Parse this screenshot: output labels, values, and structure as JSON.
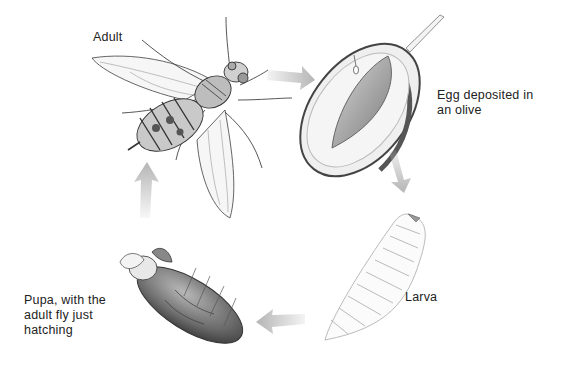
{
  "diagram": {
    "type": "life-cycle",
    "stages": [
      {
        "id": "adult",
        "label": "Adult"
      },
      {
        "id": "egg",
        "label_line1": "Egg deposited in",
        "label_line2": "an olive"
      },
      {
        "id": "larva",
        "label": "Larva"
      },
      {
        "id": "pupa",
        "label_line1": "Pupa, with the",
        "label_line2": "adult fly just",
        "label_line3": "hatching"
      }
    ],
    "arrows": [
      {
        "from": "adult",
        "to": "egg",
        "direction": "right"
      },
      {
        "from": "egg",
        "to": "larva",
        "direction": "down"
      },
      {
        "from": "larva",
        "to": "pupa",
        "direction": "left"
      },
      {
        "from": "pupa",
        "to": "adult",
        "direction": "up"
      }
    ],
    "colors": {
      "arrow": "#b5b5b5",
      "ink": "#333333",
      "olive_flesh": "#e9e9e9",
      "olive_skin": "#555555",
      "pit": "#9a9a9a",
      "pupa": "#6a6a6a",
      "text": "#222222"
    }
  }
}
